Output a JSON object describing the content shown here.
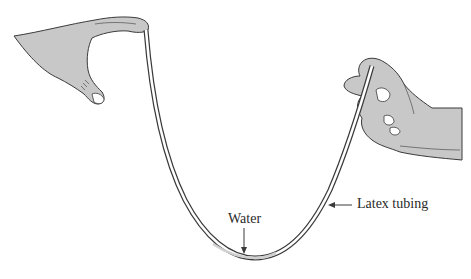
{
  "figure": {
    "labels": {
      "water": "Water",
      "latex_tubing": "Latex tubing"
    },
    "elements": {
      "left_hand": "hand pinching tube end from left",
      "right_hand": "hand holding tube end on right",
      "tube": "U-shaped latex tube",
      "water": "water column at bottom of tube"
    },
    "colors": {
      "hand_fill": "#c8c8c8",
      "outline": "#3a3a3a",
      "water_fill": "#cfcfcf",
      "background": "#ffffff"
    }
  }
}
